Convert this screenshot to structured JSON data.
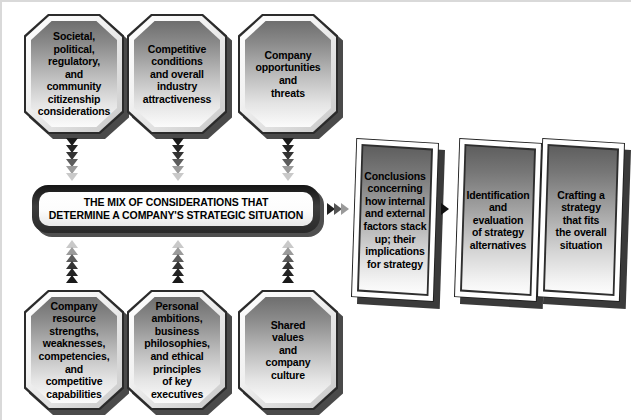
{
  "diagram": {
    "title_bar": {
      "text": "THE MIX OF CONSIDERATIONS THAT\nDETERMINE A COMPANY'S STRATEGIC SITUATION"
    },
    "top_nodes": [
      {
        "id": "societal",
        "text": "Societal,\npolitical,\nregulatory,\nand\ncommunity\ncitizenship\nconsiderations"
      },
      {
        "id": "competitive",
        "text": "Competitive\nconditions\nand overall\nindustry\nattractiveness"
      },
      {
        "id": "opportunities",
        "text": "Company\nopportunities\nand\nthreats"
      }
    ],
    "bottom_nodes": [
      {
        "id": "resources",
        "text": "Company\nresource\nstrengths,\nweaknesses,\ncompetencies,\nand\ncompetitive\ncapabilities"
      },
      {
        "id": "personal",
        "text": "Personal\nambitions,\nbusiness\nphilosophies,\nand ethical\nprinciples\nof key\nexecutives"
      },
      {
        "id": "values",
        "text": "Shared\nvalues\nand\ncompany\nculture"
      }
    ],
    "process_steps": [
      {
        "id": "conclusions",
        "text": "Conclusions\nconcerning\nhow internal\nand external\nfactors stack\nup; their\nimplications\nfor strategy"
      },
      {
        "id": "identification",
        "text": "Identification\nand\nevaluation\nof strategy\nalternatives"
      },
      {
        "id": "crafting",
        "text": "Crafting a\nstrategy\nthat fits\nthe overall\nsituation"
      }
    ],
    "colors": {
      "node_border": "#2b2b2b",
      "node_fill_top": "#6e6e6e",
      "node_fill_bottom": "#fbfbfb",
      "bar_border": "#151515",
      "bar_fill": "#ffffff",
      "arrow": "#000000",
      "background": "#ffffff"
    },
    "arrow_shades": [
      "#1a1a1a",
      "#262626",
      "#303030",
      "#4d4d4d",
      "#8c8c8c",
      "#bdbdbd"
    ]
  }
}
